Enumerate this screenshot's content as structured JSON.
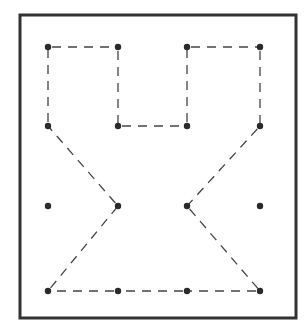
{
  "figure": {
    "type": "dot-grid-puzzle",
    "frame": {
      "x": 20,
      "y": 15,
      "width": 276,
      "height": 303,
      "stroke": "#333333",
      "stroke_width": 3
    },
    "colors": {
      "dot": "#2a2a2a",
      "dash": "#444444",
      "background": "#ffffff"
    },
    "grid": {
      "columns_x": [
        48,
        118,
        187,
        260
      ],
      "rows_y": [
        47,
        126,
        206,
        291
      ]
    },
    "dots": [
      {
        "col": 0,
        "row": 0
      },
      {
        "col": 1,
        "row": 0
      },
      {
        "col": 2,
        "row": 0
      },
      {
        "col": 3,
        "row": 0
      },
      {
        "col": 0,
        "row": 1
      },
      {
        "col": 1,
        "row": 1
      },
      {
        "col": 2,
        "row": 1
      },
      {
        "col": 3,
        "row": 1
      },
      {
        "col": 0,
        "row": 2
      },
      {
        "col": 1,
        "row": 2
      },
      {
        "col": 2,
        "row": 2
      },
      {
        "col": 3,
        "row": 2
      },
      {
        "col": 0,
        "row": 3
      },
      {
        "col": 1,
        "row": 3
      },
      {
        "col": 2,
        "row": 3
      },
      {
        "col": 3,
        "row": 3
      }
    ],
    "dashed_path": [
      [
        0,
        0
      ],
      [
        1,
        0
      ],
      [
        1,
        1
      ],
      [
        2,
        1
      ],
      [
        2,
        0
      ],
      [
        3,
        0
      ],
      [
        3,
        1
      ],
      [
        2,
        2
      ],
      [
        3,
        3
      ],
      [
        2,
        3
      ],
      [
        1,
        3
      ],
      [
        0,
        3
      ],
      [
        1,
        2
      ],
      [
        0,
        1
      ],
      [
        0,
        0
      ]
    ]
  }
}
